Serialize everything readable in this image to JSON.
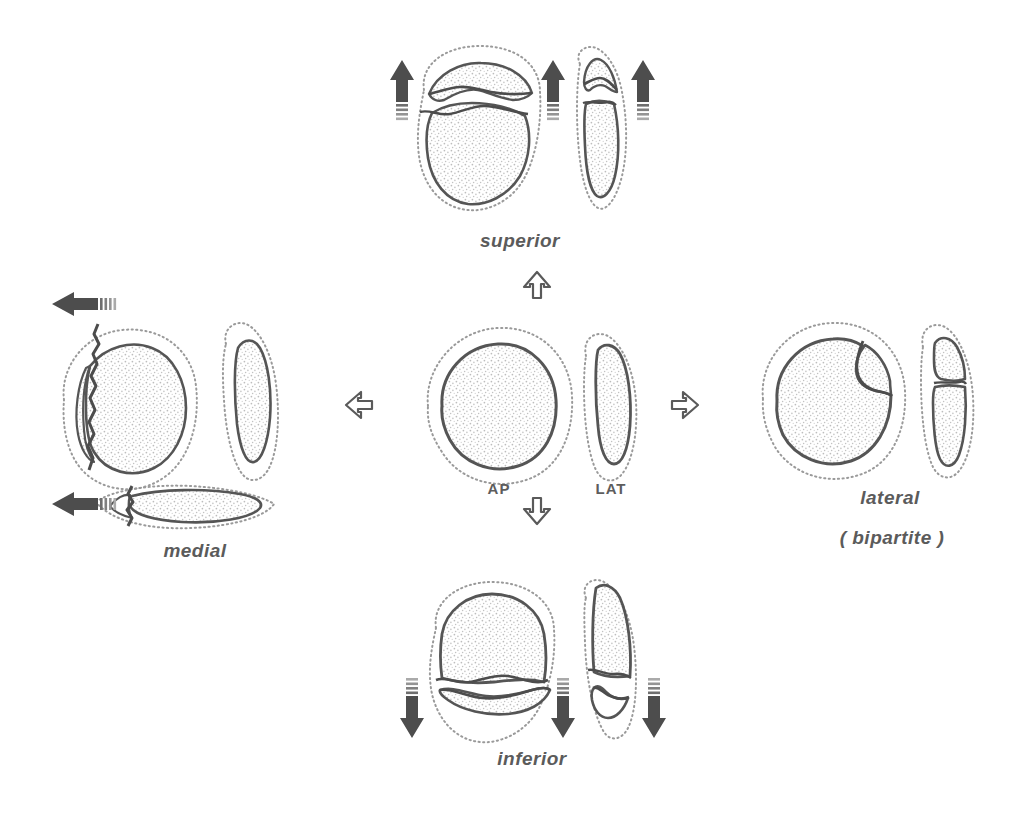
{
  "figure": {
    "kind": "anatomical-line-diagram",
    "background_color": "#ffffff",
    "ink_color": "#4a4a4a",
    "stipple_color": "#b9b9b9",
    "arrow_fill_color": "#4d4d4d"
  },
  "center": {
    "name": "intact-patella",
    "views": [
      {
        "id": "ap",
        "label": "AP"
      },
      {
        "id": "lat",
        "label": "LAT"
      }
    ]
  },
  "direction_arrows": [
    {
      "id": "arrow-up",
      "direction": "up",
      "glyph": "hollow-arrow"
    },
    {
      "id": "arrow-left",
      "direction": "left",
      "glyph": "hollow-arrow"
    },
    {
      "id": "arrow-right",
      "direction": "right",
      "glyph": "hollow-arrow"
    },
    {
      "id": "arrow-down",
      "direction": "down",
      "glyph": "hollow-arrow"
    }
  ],
  "panels": [
    {
      "id": "superior",
      "label": "superior",
      "sublabel": "",
      "position": "top",
      "views": [
        "AP",
        "LAT"
      ],
      "displacement_arrows": 3,
      "displacement_direction": "up",
      "fragment_description": "superior pole fragment displaced proximally"
    },
    {
      "id": "inferior",
      "label": "inferior",
      "sublabel": "",
      "position": "bottom",
      "views": [
        "AP",
        "LAT"
      ],
      "displacement_arrows": 3,
      "displacement_direction": "down",
      "fragment_description": "inferior pole fragment displaced distally"
    },
    {
      "id": "medial",
      "label": "medial",
      "sublabel": "",
      "position": "left",
      "views": [
        "AP",
        "LAT",
        "AXIAL"
      ],
      "displacement_arrows": 2,
      "displacement_direction": "left",
      "fragment_description": "medial marginal fragment displaced medially"
    },
    {
      "id": "lateral",
      "label": "lateral",
      "sublabel": "( bipartite )",
      "position": "right",
      "views": [
        "AP",
        "LAT"
      ],
      "displacement_arrows": 0,
      "displacement_direction": "none",
      "fragment_description": "superolateral bipartite fragment, undisplaced"
    }
  ]
}
